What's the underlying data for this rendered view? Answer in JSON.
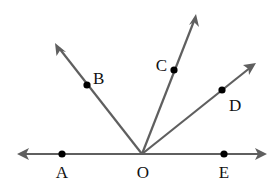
{
  "diagram": {
    "type": "rays-from-point",
    "vertex": {
      "label": "O",
      "x": 142,
      "y": 154,
      "label_x": 142,
      "label_y": 178
    },
    "line": {
      "left_tip": {
        "x": 17,
        "y": 154
      },
      "right_tip": {
        "x": 267,
        "y": 154
      }
    },
    "points": [
      {
        "label": "A",
        "x": 62,
        "y": 154,
        "label_x": 62,
        "label_y": 178
      },
      {
        "label": "E",
        "x": 224,
        "y": 154,
        "label_x": 224,
        "label_y": 178
      },
      {
        "label": "B",
        "x": 87,
        "y": 85,
        "label_x": 98,
        "label_y": 84,
        "tip_x": 55,
        "tip_y": 43
      },
      {
        "label": "C",
        "x": 174,
        "y": 70,
        "label_x": 161,
        "label_y": 70,
        "tip_x": 196,
        "tip_y": 14
      },
      {
        "label": "D",
        "x": 222,
        "y": 90,
        "label_x": 236,
        "label_y": 111,
        "tip_x": 256,
        "tip_y": 63
      }
    ],
    "colors": {
      "ray": "#5f5f5f",
      "dot": "#000000",
      "label": "#111111"
    }
  },
  "labels": {
    "O": "O",
    "A": "A",
    "E": "E",
    "B": "B",
    "C": "C",
    "D": "D"
  }
}
